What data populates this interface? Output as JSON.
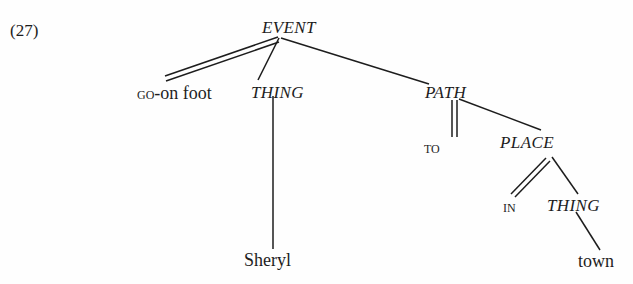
{
  "figure": {
    "example_number": "(27)",
    "type": "conceptual-structure-tree",
    "ink_color": "#1d1d1d",
    "background_color": "#fefefe"
  },
  "nodes": {
    "event": {
      "label": "EVENT",
      "style": "italic"
    },
    "go_on_foot": {
      "label": "GO-on foot",
      "small_caps_part": "GO",
      "plain_part": "-on foot"
    },
    "thing_subject": {
      "label": "THING",
      "style": "italic"
    },
    "sheryl": {
      "label": "Sheryl",
      "style": "roman"
    },
    "path": {
      "label": "PATH",
      "style": "italic"
    },
    "to": {
      "label": "TO",
      "style": "small-caps"
    },
    "place": {
      "label": "PLACE",
      "style": "italic"
    },
    "in": {
      "label": "IN",
      "style": "small-caps"
    },
    "thing_object": {
      "label": "THING",
      "style": "italic"
    },
    "town": {
      "label": "town",
      "style": "roman"
    }
  },
  "edges": [
    {
      "from": "event",
      "to": "go_on_foot",
      "line": "double"
    },
    {
      "from": "event",
      "to": "thing_subject",
      "line": "single"
    },
    {
      "from": "event",
      "to": "path",
      "line": "single"
    },
    {
      "from": "thing_subject",
      "to": "sheryl",
      "line": "single"
    },
    {
      "from": "path",
      "to": "to",
      "line": "double"
    },
    {
      "from": "path",
      "to": "place",
      "line": "single"
    },
    {
      "from": "place",
      "to": "in",
      "line": "double"
    },
    {
      "from": "place",
      "to": "thing_object",
      "line": "single"
    },
    {
      "from": "thing_object",
      "to": "town",
      "line": "single"
    }
  ]
}
